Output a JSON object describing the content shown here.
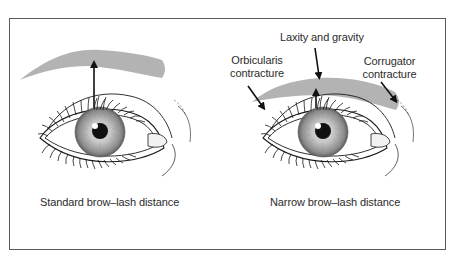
{
  "figure": {
    "panels": [
      {
        "id": "standard",
        "caption": "Standard brow–lash distance",
        "annotations": []
      },
      {
        "id": "narrow",
        "caption": "Narrow brow–lash distance",
        "annotations": [
          {
            "line1": "Laxity and gravity"
          },
          {
            "line1": "Orbicularis",
            "line2": "contracture"
          },
          {
            "line1": "Corrugator",
            "line2": "contracture"
          }
        ]
      }
    ],
    "colors": {
      "frame": "#5a5a5a",
      "brow": "#b3b3b3",
      "iris_outer": "#7a7a7a",
      "iris_inner": "#d8d8d8",
      "pupil": "#111111",
      "line": "#1a1a1a",
      "text": "#2b2b2b"
    }
  }
}
